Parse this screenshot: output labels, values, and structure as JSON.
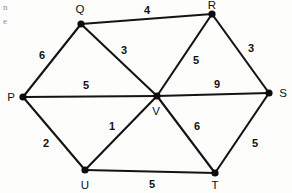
{
  "figure": {
    "kind": "weighted-undirected-graph-diagram",
    "width": 292,
    "height": 193,
    "background_color": "#fdfdfc",
    "ink_color": "#141414"
  },
  "margin_artifacts": [
    {
      "id": "m1",
      "text": "n",
      "x": 3,
      "y": 10
    },
    {
      "id": "m2",
      "text": "e",
      "x": 3,
      "y": 24
    }
  ],
  "nodes": [
    {
      "id": "P",
      "label": "P",
      "x": 23,
      "y": 97,
      "label_x": 11,
      "label_y": 101,
      "label_anchor": "middle"
    },
    {
      "id": "Q",
      "label": "Q",
      "x": 81,
      "y": 24,
      "label_x": 80,
      "label_y": 13,
      "label_anchor": "middle"
    },
    {
      "id": "R",
      "label": "R",
      "x": 212,
      "y": 14,
      "label_x": 212,
      "label_y": 9,
      "label_anchor": "middle"
    },
    {
      "id": "S",
      "label": "S",
      "x": 269,
      "y": 93,
      "label_x": 283,
      "label_y": 97,
      "label_anchor": "middle"
    },
    {
      "id": "T",
      "label": "T",
      "x": 215,
      "y": 173,
      "label_x": 215,
      "label_y": 189,
      "label_anchor": "middle"
    },
    {
      "id": "U",
      "label": "U",
      "x": 85,
      "y": 170,
      "label_x": 85,
      "label_y": 189,
      "label_anchor": "middle"
    },
    {
      "id": "V",
      "label": "V",
      "x": 157,
      "y": 96,
      "label_x": 156,
      "label_y": 115,
      "label_anchor": "middle"
    }
  ],
  "edges": [
    {
      "id": "PQ",
      "from": "P",
      "to": "Q",
      "weight": "6",
      "weight_x": 42,
      "weight_y": 59
    },
    {
      "id": "QR",
      "from": "Q",
      "to": "R",
      "weight": "4",
      "weight_x": 147,
      "weight_y": 14
    },
    {
      "id": "QV",
      "from": "Q",
      "to": "V",
      "weight": "3",
      "weight_x": 124,
      "weight_y": 54
    },
    {
      "id": "RV",
      "from": "R",
      "to": "V",
      "weight": "5",
      "weight_x": 196,
      "weight_y": 64
    },
    {
      "id": "RS",
      "from": "R",
      "to": "S",
      "weight": "3",
      "weight_x": 251,
      "weight_y": 52
    },
    {
      "id": "PV",
      "from": "P",
      "to": "V",
      "weight": "5",
      "weight_x": 86,
      "weight_y": 89
    },
    {
      "id": "VS",
      "from": "V",
      "to": "S",
      "weight": "9",
      "weight_x": 217,
      "weight_y": 88
    },
    {
      "id": "PU",
      "from": "P",
      "to": "U",
      "weight": "2",
      "weight_x": 46,
      "weight_y": 147
    },
    {
      "id": "UV",
      "from": "U",
      "to": "V",
      "weight": "1",
      "weight_x": 112,
      "weight_y": 130
    },
    {
      "id": "VT",
      "from": "V",
      "to": "T",
      "weight": "6",
      "weight_x": 197,
      "weight_y": 130
    },
    {
      "id": "TS",
      "from": "T",
      "to": "S",
      "weight": "5",
      "weight_x": 255,
      "weight_y": 147
    },
    {
      "id": "UT",
      "from": "U",
      "to": "T",
      "weight": "5",
      "weight_x": 152,
      "weight_y": 188
    }
  ]
}
